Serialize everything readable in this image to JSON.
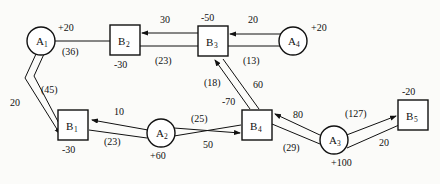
{
  "diagram": {
    "type": "network-flow-diagram",
    "colors": {
      "background": "#fbfbf9",
      "stroke": "#111111",
      "node_fill": "#ffffff"
    },
    "nodes": [
      {
        "id": "A1",
        "shape": "circle",
        "label": "A",
        "subscript": "1",
        "value": "+20",
        "cx": 41,
        "cy": 41
      },
      {
        "id": "A2",
        "shape": "circle",
        "label": "A",
        "subscript": "2",
        "value": "+60",
        "cx": 161,
        "cy": 133
      },
      {
        "id": "A3",
        "shape": "circle",
        "label": "A",
        "subscript": "3",
        "value": "+100",
        "cx": 334,
        "cy": 140
      },
      {
        "id": "A4",
        "shape": "circle",
        "label": "A",
        "subscript": "4",
        "value": "+20",
        "cx": 293,
        "cy": 41
      },
      {
        "id": "B1",
        "shape": "square",
        "label": "B",
        "subscript": "1",
        "value": "-30",
        "cx": 73,
        "cy": 125
      },
      {
        "id": "B2",
        "shape": "square",
        "label": "B",
        "subscript": "2",
        "value": "-30",
        "cx": 125,
        "cy": 40
      },
      {
        "id": "B3",
        "shape": "square",
        "label": "B",
        "subscript": "3",
        "value": "-50",
        "cx": 213,
        "cy": 41
      },
      {
        "id": "B4",
        "shape": "square",
        "label": "B",
        "subscript": "4",
        "value": "-70",
        "cx": 257,
        "cy": 125
      },
      {
        "id": "B5",
        "shape": "square",
        "label": "B",
        "subscript": "5",
        "value": "-20",
        "cx": 413,
        "cy": 115
      }
    ],
    "edges": [
      {
        "from": "A1",
        "to": "B2",
        "flow": "+20",
        "cost": "(36)"
      },
      {
        "from": "A1",
        "to": "B1",
        "flow": "20",
        "cost": "(45)"
      },
      {
        "from": "B3",
        "to": "B2",
        "flow": "30",
        "cost": "(23)"
      },
      {
        "from": "A4",
        "to": "B3",
        "flow": "20",
        "cost": "(13)"
      },
      {
        "from": "B4",
        "to": "B3",
        "flow": "60",
        "cost": "(18)"
      },
      {
        "from": "A2",
        "to": "B1",
        "flow": "10",
        "cost": "(23)"
      },
      {
        "from": "A2",
        "to": "B4",
        "flow": "50",
        "cost": "(25)"
      },
      {
        "from": "A3",
        "to": "B4",
        "flow": "80",
        "cost": "(29)"
      },
      {
        "from": "A3",
        "to": "B5",
        "flow": "20",
        "cost": "(127)"
      }
    ]
  }
}
